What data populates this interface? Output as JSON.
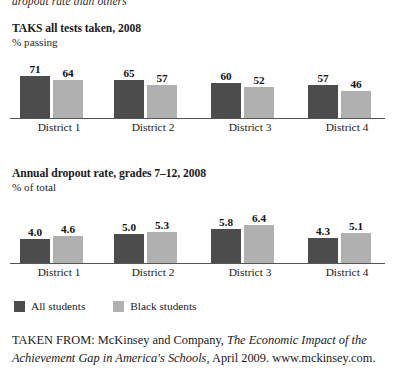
{
  "caption_tail": "dropout rate than others",
  "legend": {
    "items": [
      {
        "label": "All students",
        "color": "#4c4c4c",
        "swatch": "dark"
      },
      {
        "label": "Black students",
        "color": "#b0b0b0",
        "swatch": "light"
      }
    ]
  },
  "source": {
    "prefix": "TAKEN FROM: McKinsey and Company, ",
    "title_italic": "The Economic Impact of the Achievement Gap in America's Schools",
    "suffix": ", April 2009. www.mckinsey.com."
  },
  "chart_data": [
    {
      "type": "bar",
      "id": "taks-all-tests",
      "title": "TAKS all tests taken, 2008",
      "subtitle": "% passing",
      "ylabel": "% passing",
      "xlabel": "",
      "grid": false,
      "legend_position": "below-figure",
      "ylim": [
        0,
        80
      ],
      "categories": [
        "District 1",
        "District 2",
        "District 3",
        "District 4"
      ],
      "series": [
        {
          "name": "All students",
          "color": "#4c4c4c",
          "values": [
            71,
            65,
            60,
            57
          ],
          "labels": [
            "71",
            "65",
            "60",
            "57"
          ]
        },
        {
          "name": "Black students",
          "color": "#b0b0b0",
          "values": [
            64,
            57,
            52,
            46
          ],
          "labels": [
            "64",
            "57",
            "52",
            "46"
          ]
        }
      ]
    },
    {
      "type": "bar",
      "id": "annual-dropout-rate",
      "title": "Annual dropout rate, grades 7–12, 2008",
      "subtitle": "% of total",
      "ylabel": "% of total",
      "xlabel": "",
      "grid": false,
      "legend_position": "below-figure",
      "ylim": [
        0,
        8
      ],
      "categories": [
        "District 1",
        "District 2",
        "District 3",
        "District 4"
      ],
      "series": [
        {
          "name": "All students",
          "color": "#4c4c4c",
          "values": [
            4.0,
            5.0,
            5.8,
            4.3
          ],
          "labels": [
            "4.0",
            "5.0",
            "5.8",
            "4.3"
          ]
        },
        {
          "name": "Black students",
          "color": "#b0b0b0",
          "values": [
            4.6,
            5.3,
            6.4,
            5.1
          ],
          "labels": [
            "4.6",
            "5.3",
            "6.4",
            "5.1"
          ]
        }
      ]
    }
  ]
}
